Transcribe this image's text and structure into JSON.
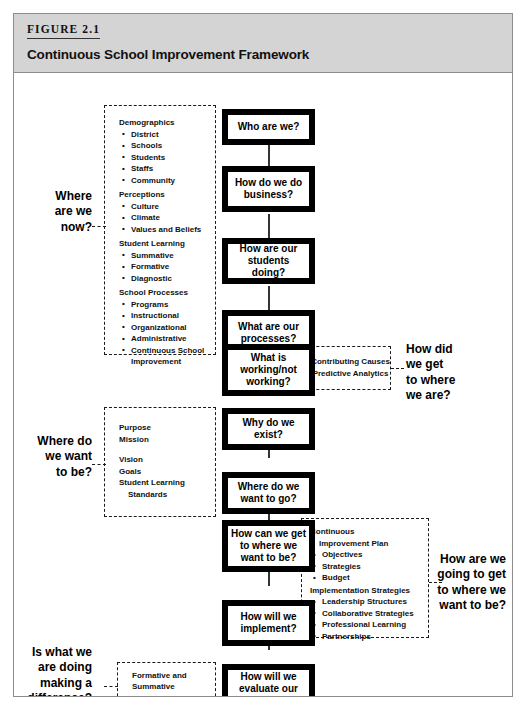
{
  "header": {
    "figure_number": "FIGURE 2.1",
    "title": "Continuous School Improvement Framework"
  },
  "boxes": [
    {
      "id": "who-are-we",
      "label": "Who are we?"
    },
    {
      "id": "how-do-we-do-business",
      "label": "How do we do business?"
    },
    {
      "id": "how-are-our-students-doing",
      "label": "How are our students doing?"
    },
    {
      "id": "what-are-our-processes",
      "label": "What are our processes?"
    },
    {
      "id": "what-is-working",
      "label": "What is working/not working?"
    },
    {
      "id": "why-do-we-exist",
      "label": "Why do we exist?"
    },
    {
      "id": "where-do-we-want-to-go",
      "label": "Where do we want to go?"
    },
    {
      "id": "how-can-we-get-there",
      "label": "How can we get to where we want to be?"
    },
    {
      "id": "how-will-we-implement",
      "label": "How will we implement?"
    },
    {
      "id": "how-will-we-evaluate",
      "label": "How will we evaluate our efforts?"
    }
  ],
  "questions": {
    "where_are_we_now": "Where\nare we\nnow?",
    "how_did_we_get": "How did\nwe get\nto where\nwe are?",
    "where_do_we_want_to_be": "Where do\nwe want\nto be?",
    "how_are_we_going_to_get": "How are we\ngoing to get\nto where we\nwant to be?",
    "is_what_we_are_doing": "Is what we\nare doing\nmaking a\ndifference?"
  },
  "panels": {
    "data_panel": {
      "groups": [
        {
          "head": "Demographics",
          "items": [
            "District",
            "Schools",
            "Students",
            "Staffs",
            "Community"
          ]
        },
        {
          "head": "Perceptions",
          "items": [
            "Culture",
            "Climate",
            "Values and Beliefs"
          ]
        },
        {
          "head": "Student Learning",
          "items": [
            "Summative",
            "Formative",
            "Diagnostic"
          ]
        },
        {
          "head": "School Processes",
          "items": [
            "Programs",
            "Instructional",
            "Organizational",
            "Administrative",
            "Continuous School Improvement"
          ]
        }
      ]
    },
    "causes_panel": {
      "lines": [
        "Contributing Causes",
        "Predictive Analytics"
      ]
    },
    "purpose_panel": {
      "lines": [
        "Purpose",
        "Mission",
        "",
        "Vision",
        "Goals",
        "Student Learning",
        "Standards"
      ]
    },
    "plan_panel": {
      "groups": [
        {
          "head": "Continuous",
          "head2": "Improvement Plan",
          "items": [
            "Objectives",
            "Strategies",
            "Budget"
          ]
        },
        {
          "head": "Implementation Strategies",
          "items": [
            "Leadership Structures",
            "Collaborative Strategies",
            "Professional Learning",
            "Partnerships"
          ]
        }
      ]
    },
    "evaluation_panel": {
      "lines": [
        "Formative and",
        "Summative",
        "Evaluation"
      ]
    }
  },
  "colors": {
    "header_band": "#d4d4d4",
    "frame_border": "#8c8c8c",
    "box_border": "#000000",
    "text": "#111111"
  }
}
